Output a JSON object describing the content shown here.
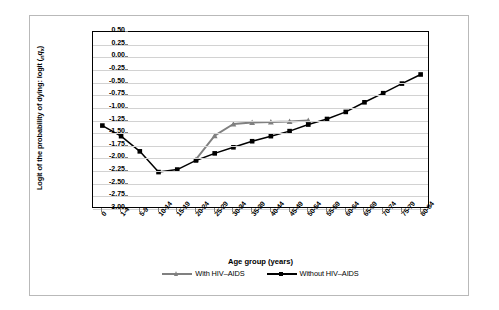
{
  "chart_data": {
    "type": "line",
    "title": "",
    "xlabel": "Age group (years)",
    "ylabel": "Logit of the probability of dying: logit (nqx)",
    "ylim": [
      -3.0,
      0.5
    ],
    "ytick_step": 0.25,
    "grid": true,
    "legend_position": "bottom-center",
    "categories": [
      "0",
      "1-4",
      "5-9",
      "10-14",
      "15-19",
      "20-24",
      "25-29",
      "30-34",
      "35-39",
      "40-44",
      "45-49",
      "50-54",
      "55-59",
      "60-64",
      "65-69",
      "70-74",
      "75-79",
      "80-84"
    ],
    "ytick_labels": [
      "0.50",
      "0.25",
      "0.00",
      "-0.25",
      "-0.50",
      "-0.75",
      "-1.00",
      "-1.25",
      "-1.50",
      "-1.75",
      "-2.00",
      "-2.25",
      "-2.50",
      "-2.75",
      "-3.00"
    ],
    "series": [
      {
        "name": "With HIV–AIDS",
        "color": "#808080",
        "marker": "triangle",
        "x_start_index": 5,
        "values": [
          null,
          null,
          null,
          null,
          null,
          -2.02,
          -1.55,
          -1.32,
          -1.29,
          -1.28,
          -1.27,
          -1.25,
          null,
          null,
          null,
          null,
          null,
          null
        ]
      },
      {
        "name": "Without HIV–AIDS",
        "color": "#000000",
        "marker": "square",
        "x_start_index": 0,
        "values": [
          -1.35,
          -1.56,
          -1.86,
          -2.27,
          -2.22,
          -2.04,
          -1.9,
          -1.78,
          -1.66,
          -1.56,
          -1.46,
          -1.33,
          -1.22,
          -1.08,
          -0.89,
          -0.71,
          -0.52,
          -0.34
        ]
      }
    ]
  },
  "axis": {
    "y_title_main": "Logit of the probability of dying: logit (",
    "y_title_sub_n": "n",
    "y_title_q": "q",
    "y_title_sub_x": "x",
    "y_title_close": ")",
    "x_title": "Age group (years)"
  },
  "legend": {
    "items": [
      {
        "label": "With HIV–AIDS",
        "color": "#808080",
        "marker": "triangle"
      },
      {
        "label": "Without HIV–AIDS",
        "color": "#000000",
        "marker": "square"
      }
    ]
  }
}
